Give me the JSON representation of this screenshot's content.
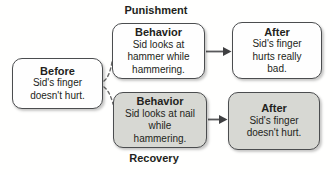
{
  "colors": {
    "background": "#fffffe",
    "box_white": "#fefefe",
    "box_gray": "#d7d8d3",
    "border": "#4b4d4f",
    "text": "#231f20",
    "arrow": "#58595b"
  },
  "before": {
    "title": "Before",
    "body": "Sid's finger\ndoesn't hurt."
  },
  "punishment": {
    "label": "Punishment",
    "behavior": {
      "title": "Behavior",
      "body": "Sid looks at\nhammer while\nhammering."
    },
    "after": {
      "title": "After",
      "body": "Sid's finger\nhurts really\nbad."
    }
  },
  "recovery": {
    "label": "Recovery",
    "behavior": {
      "title": "Behavior",
      "body": "Sid looks at nail\nwhile\nhammering."
    },
    "after": {
      "title": "After",
      "body": "Sid's finger\ndoesn't hurt."
    }
  }
}
